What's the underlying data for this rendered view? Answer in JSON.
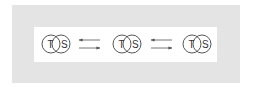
{
  "diagram": {
    "colors": {
      "outer_panel": "#e4e4e4",
      "inner_box": "#ffffff",
      "stroke": "#444444",
      "text": "#333333"
    },
    "states": [
      {
        "left_label": "T",
        "right_label": "S"
      },
      {
        "left_label": "T",
        "right_label": "S"
      },
      {
        "left_label": "T",
        "right_label": "S"
      }
    ],
    "transitions": [
      {
        "top_arrow": "left",
        "bottom_arrow": "right"
      },
      {
        "top_arrow": "left",
        "bottom_arrow": "right"
      }
    ]
  }
}
